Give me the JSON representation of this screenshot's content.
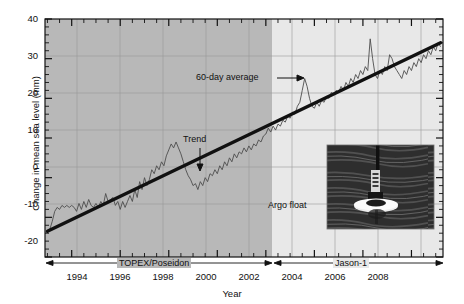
{
  "chart_data": {
    "type": "line",
    "title": "",
    "xlabel": "Year",
    "ylabel": "Change in mean sea level (mm)",
    "xlim": [
      1992.9,
      2009.3
    ],
    "ylim": [
      -20,
      40
    ],
    "xticks": [
      1994,
      1996,
      1998,
      2000,
      2002,
      2004,
      2006,
      2008
    ],
    "xtick_labels": [
      "1994",
      "1996",
      "1998",
      "2000",
      "2002",
      "2004",
      "2006",
      "2008"
    ],
    "x_minor_tick_interval": 0.5,
    "yticks": [
      -20,
      -10,
      0,
      10,
      20,
      30,
      40
    ],
    "ytick_labels": [
      "-20",
      "-10",
      "0",
      "10",
      "20",
      "30",
      "40"
    ],
    "y_minor_tick_interval": 2,
    "grid": true,
    "grid_x_interval": 2,
    "grid_y_interval": 10,
    "legend": "none",
    "series": [
      {
        "name": "60-day average",
        "style": "thin-line",
        "color": "#4d4d4d",
        "x": [
          1993.0,
          1993.1,
          1993.2,
          1993.3,
          1993.4,
          1993.5,
          1993.6,
          1993.7,
          1993.8,
          1993.9,
          1994.0,
          1994.1,
          1994.2,
          1994.3,
          1994.4,
          1994.5,
          1994.6,
          1994.7,
          1994.8,
          1994.9,
          1995.0,
          1995.1,
          1995.2,
          1995.3,
          1995.4,
          1995.5,
          1995.6,
          1995.7,
          1995.8,
          1995.9,
          1996.0,
          1996.1,
          1996.2,
          1996.3,
          1996.4,
          1996.5,
          1996.6,
          1996.7,
          1996.8,
          1996.9,
          1997.0,
          1997.1,
          1997.2,
          1997.3,
          1997.4,
          1997.5,
          1997.6,
          1997.7,
          1997.8,
          1997.9,
          1998.0,
          1998.1,
          1998.2,
          1998.3,
          1998.4,
          1998.5,
          1998.6,
          1998.7,
          1998.8,
          1998.9,
          1999.0,
          1999.1,
          1999.2,
          1999.3,
          1999.4,
          1999.5,
          1999.6,
          1999.7,
          1999.8,
          1999.9,
          2000.0,
          2000.1,
          2000.2,
          2000.3,
          2000.4,
          2000.5,
          2000.6,
          2000.7,
          2000.8,
          2000.9,
          2001.0,
          2001.1,
          2001.2,
          2001.3,
          2001.4,
          2001.5,
          2001.6,
          2001.7,
          2001.8,
          2001.9,
          2002.0,
          2002.1,
          2002.2,
          2002.3,
          2002.4,
          2002.5,
          2002.6,
          2002.7,
          2002.8,
          2002.9,
          2003.0,
          2003.1,
          2003.2,
          2003.3,
          2003.4,
          2003.5,
          2003.6,
          2003.7,
          2003.8,
          2003.9,
          2004.0,
          2004.1,
          2004.2,
          2004.3,
          2004.4,
          2004.5,
          2004.6,
          2004.7,
          2004.8,
          2004.9,
          2005.0,
          2005.1,
          2005.2,
          2005.3,
          2005.4,
          2005.5,
          2005.6,
          2005.7,
          2005.8,
          2005.9,
          2006.0,
          2006.1,
          2006.2,
          2006.3,
          2006.4,
          2006.5,
          2006.6,
          2006.7,
          2006.8,
          2006.9,
          2007.0,
          2007.1,
          2007.2,
          2007.3,
          2007.4,
          2007.5,
          2007.6,
          2007.7,
          2007.8,
          2007.9,
          2008.0,
          2008.1,
          2008.2,
          2008.3,
          2008.4,
          2008.5,
          2008.6,
          2008.7,
          2008.8,
          2008.9,
          2009.0,
          2009.1,
          2009.2
        ],
        "y": [
          -13.5,
          -13.0,
          -11.0,
          -8.5,
          -7.5,
          -8.0,
          -7.0,
          -7.5,
          -7.0,
          -7.5,
          -7.0,
          -7.5,
          -8.5,
          -6.5,
          -8.0,
          -6.0,
          -7.5,
          -5.5,
          -7.0,
          -7.5,
          -6.5,
          -7.5,
          -6.0,
          -7.0,
          -4.0,
          -6.0,
          -5.5,
          -5.0,
          -7.0,
          -6.0,
          -8.0,
          -6.0,
          -7.5,
          -6.0,
          -4.5,
          -6.0,
          -3.0,
          -5.0,
          -1.0,
          -3.0,
          0.0,
          -2.0,
          -0.5,
          2.0,
          1.0,
          3.0,
          2.0,
          4.0,
          3.0,
          5.5,
          7.0,
          8.5,
          7.5,
          9.0,
          7.5,
          6.0,
          4.0,
          2.0,
          0.5,
          -0.5,
          -2.0,
          -1.5,
          -3.0,
          -1.0,
          -2.0,
          0.0,
          -1.0,
          1.0,
          0.5,
          2.0,
          1.0,
          3.0,
          2.0,
          4.0,
          3.0,
          5.0,
          4.0,
          6.0,
          5.0,
          6.5,
          6.0,
          7.5,
          6.5,
          8.0,
          7.0,
          8.5,
          8.0,
          9.5,
          9.0,
          10.5,
          11.0,
          12.5,
          11.5,
          13.0,
          12.0,
          13.5,
          13.0,
          14.5,
          14.0,
          15.5,
          15.0,
          16.5,
          16.0,
          18.0,
          19.0,
          22.0,
          25.0,
          23.0,
          20.0,
          18.0,
          17.5,
          19.0,
          18.0,
          19.5,
          19.0,
          20.5,
          20.0,
          21.5,
          21.0,
          22.0,
          21.5,
          23.0,
          22.0,
          24.0,
          23.0,
          25.0,
          24.0,
          26.0,
          25.0,
          27.0,
          26.0,
          28.0,
          27.0,
          35.0,
          30.0,
          26.0,
          25.0,
          27.0,
          26.0,
          28.0,
          27.0,
          31.0,
          30.0,
          28.0,
          27.0,
          26.0,
          25.0,
          27.0,
          26.0,
          28.0,
          27.0,
          29.0,
          28.0,
          30.0,
          29.0,
          31.0,
          30.0,
          32.0,
          31.0,
          33.0,
          32.0,
          34.0,
          33.0
        ]
      },
      {
        "name": "Trend",
        "style": "thick-line",
        "color": "#111111",
        "x": [
          1993.0,
          2009.2
        ],
        "y": [
          -13.5,
          34.0
        ],
        "slope_mm_per_year": 2.93
      }
    ],
    "shaded_regions": [
      {
        "x0": 1992.9,
        "x1": 2001.85,
        "color": "#b8b8b8",
        "label": "TOPEX/Poseidon era"
      },
      {
        "x0": 2001.85,
        "x1": 2009.3,
        "color": "#e6e6e6",
        "label": "Jason-1 era"
      }
    ],
    "annotations": [
      {
        "name": "sixty-day-average",
        "text": "60-day average",
        "arrow": "right"
      },
      {
        "name": "trend",
        "text": "Trend",
        "arrow": "down"
      },
      {
        "name": "argo-float",
        "text": "Argo float",
        "arrow": "none"
      }
    ],
    "mission_spans": [
      {
        "label": "TOPEX/Poseidon",
        "x0": 1993.0,
        "x1": 2001.85
      },
      {
        "label": "Jason-1",
        "x0": 2001.9,
        "x1": 2009.2
      }
    ]
  }
}
